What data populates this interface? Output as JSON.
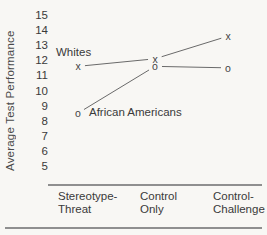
{
  "figure": {
    "background": "#f8f7f4",
    "text_color": "#3a3a3a",
    "line_color": "#6a6a6a"
  },
  "chart_data": {
    "type": "line",
    "title": "",
    "xlabel": "",
    "ylabel": "Average Test Performance",
    "ylim": [
      5,
      15
    ],
    "yticks": [
      15,
      14,
      13,
      12,
      11,
      10,
      9,
      8,
      7,
      6,
      5
    ],
    "categories": [
      "Stereotype-Threat",
      "Control Only",
      "Control-Challenge"
    ],
    "category_label_lines": [
      [
        "Stereotype-",
        "Threat"
      ],
      [
        "Control",
        "Only"
      ],
      [
        "Control-",
        "Challenge"
      ]
    ],
    "series": [
      {
        "name": "Whites",
        "marker": "x",
        "values": [
          11.6,
          12.1,
          13.6
        ]
      },
      {
        "name": "African Americans",
        "marker": "o",
        "values": [
          8.5,
          11.6,
          11.5
        ]
      }
    ],
    "grid": false,
    "legend_position": "inline-annotations"
  }
}
